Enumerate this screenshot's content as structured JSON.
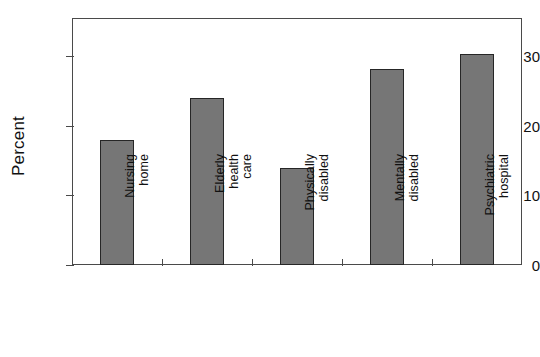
{
  "chart_data": {
    "type": "bar",
    "title": "",
    "xlabel": "",
    "ylabel": "Percent",
    "categories": [
      "Nursing\nhome",
      "Elderly\nhealth\ncare",
      "Physically\ndisabled",
      "Mentally\ndisabled",
      "Psychiatric\nhospital"
    ],
    "values": [
      18,
      24,
      14,
      28.2,
      30.3
    ],
    "ylim": [
      0,
      35.5
    ],
    "yticks": [
      0,
      10,
      20,
      30
    ],
    "ytick_labels": [
      "0",
      "10",
      "20",
      "30"
    ],
    "grid": false,
    "legend": false,
    "bar_color": "#767676",
    "bar_edge_color": "#262626",
    "axis_color": "#4a4a4a",
    "background_color": "#ffffff"
  },
  "axis": {
    "y_title": "Percent"
  }
}
